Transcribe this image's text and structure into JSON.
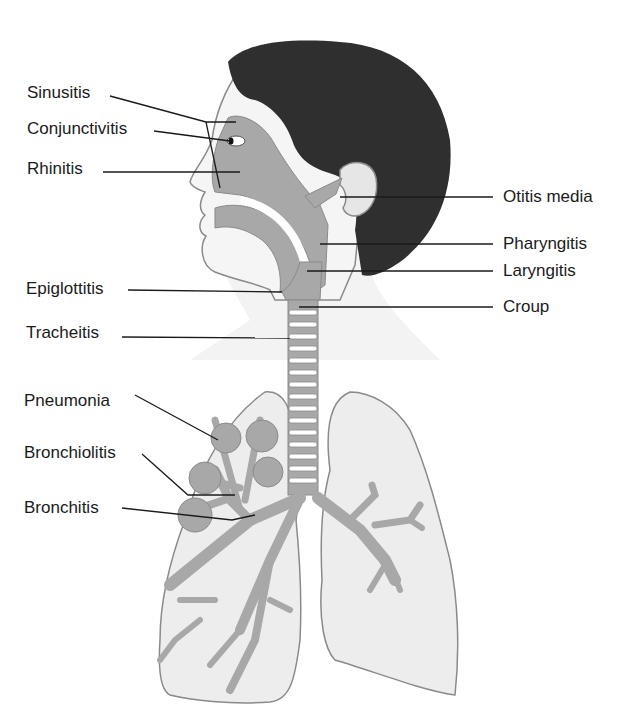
{
  "diagram": {
    "colors": {
      "hair": "#2f2f2f",
      "skin": "#f4f4f4",
      "airway": "#a8a8a8",
      "lung": "#ededed",
      "outline": "#8a8a8a",
      "leader": "#1a1a1a",
      "text": "#1a1a1a"
    },
    "labels_left": [
      {
        "text": "Sinusitis"
      },
      {
        "text": "Conjunctivitis"
      },
      {
        "text": "Rhinitis"
      },
      {
        "text": "Epiglottitis"
      },
      {
        "text": "Tracheitis"
      },
      {
        "text": "Pneumonia"
      },
      {
        "text": "Bronchiolitis"
      },
      {
        "text": "Bronchitis"
      }
    ],
    "labels_right": [
      {
        "text": "Otitis media"
      },
      {
        "text": "Pharyngitis"
      },
      {
        "text": "Laryngitis"
      },
      {
        "text": "Croup"
      }
    ]
  }
}
